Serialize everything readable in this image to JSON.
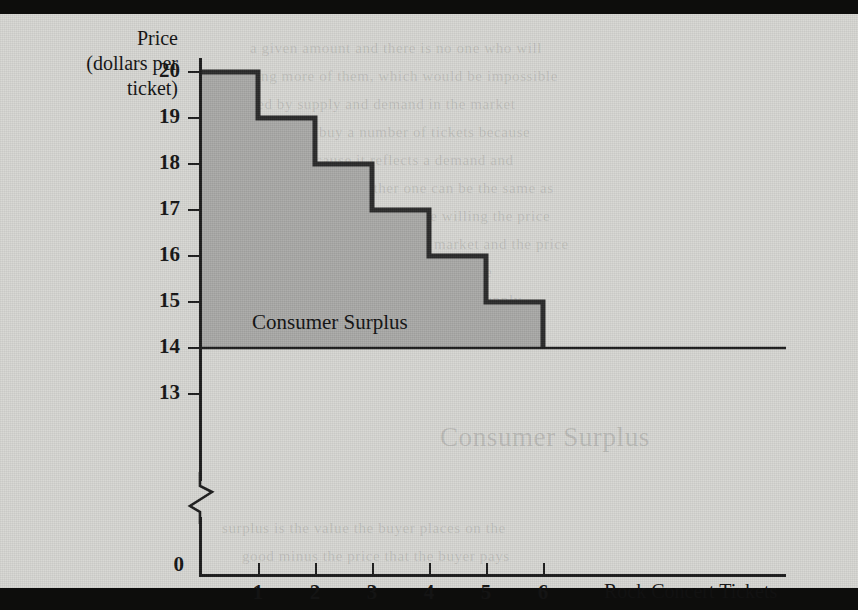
{
  "figure": {
    "surplus_label": "Consumer Surplus",
    "y_axis_title_line1": "Price",
    "y_axis_title_line2": "(dollars per",
    "y_axis_title_line3": "ticket)",
    "x_axis_title": "Rock Concert Tickets",
    "zero_label": "0"
  },
  "colors": {
    "paper": "#d7d7d3",
    "ink": "#1c1c1c",
    "surplus_fill": "#a9a9a7",
    "scan_band": "#0d0d0c"
  },
  "chart_data": {
    "type": "bar",
    "title": "Consumer Surplus",
    "xlabel": "Rock Concert Tickets",
    "ylabel": "Price (dollars per ticket)",
    "categories": [
      "1",
      "2",
      "3",
      "4",
      "5",
      "6"
    ],
    "values": [
      20,
      19,
      18,
      17,
      16,
      15
    ],
    "series": [
      {
        "name": "Willingness to pay (demand)",
        "values": [
          20,
          19,
          18,
          17,
          16,
          15
        ]
      }
    ],
    "market_price": 14,
    "consumer_surplus_per_unit": [
      6,
      5,
      4,
      3,
      2,
      1
    ],
    "total_consumer_surplus": 21,
    "ytick_labels": [
      "20",
      "19",
      "18",
      "17",
      "16",
      "15",
      "14",
      "13",
      "0"
    ],
    "ytick_values": [
      20,
      19,
      18,
      17,
      16,
      15,
      14,
      13,
      0
    ],
    "xtick_labels": [
      "1",
      "2",
      "3",
      "4",
      "5",
      "6"
    ],
    "ylim": [
      13,
      20
    ],
    "axis_break": true,
    "grid": false,
    "legend": "none",
    "annotations": [
      {
        "text": "Consumer Surplus",
        "x": 2.1,
        "y": 15.6
      }
    ]
  },
  "showthrough": [
    {
      "text": "a given amount and there is no one who will",
      "x": 250,
      "y": 26
    },
    {
      "text": "buying more of them, which would be impossible",
      "x": 232,
      "y": 54
    },
    {
      "text": "mined by supply and demand in the market",
      "x": 232,
      "y": 82
    },
    {
      "text": "ticket. They buy a number of tickets because",
      "x": 236,
      "y": 110
    },
    {
      "text": "suggests because it reflects a demand and",
      "x": 240,
      "y": 138
    },
    {
      "text": "profits, quantity. If neither one can be the same as",
      "x": 224,
      "y": 166
    },
    {
      "text": "it can be the quantity in a more willing the price",
      "x": 232,
      "y": 194
    },
    {
      "text": "the first consumer so all of the market and the price",
      "x": 228,
      "y": 222
    },
    {
      "text": "the whole amount as a result, it is the",
      "x": 246,
      "y": 250
    },
    {
      "text": "and the amount. How do we see the supply",
      "x": 240,
      "y": 278
    },
    {
      "text": "Consumer Surplus",
      "x": 440,
      "y": 408,
      "big": true
    },
    {
      "text": "surplus is the value the buyer places on the",
      "x": 222,
      "y": 506
    },
    {
      "text": "good minus the price that the buyer pays",
      "x": 242,
      "y": 534
    }
  ]
}
